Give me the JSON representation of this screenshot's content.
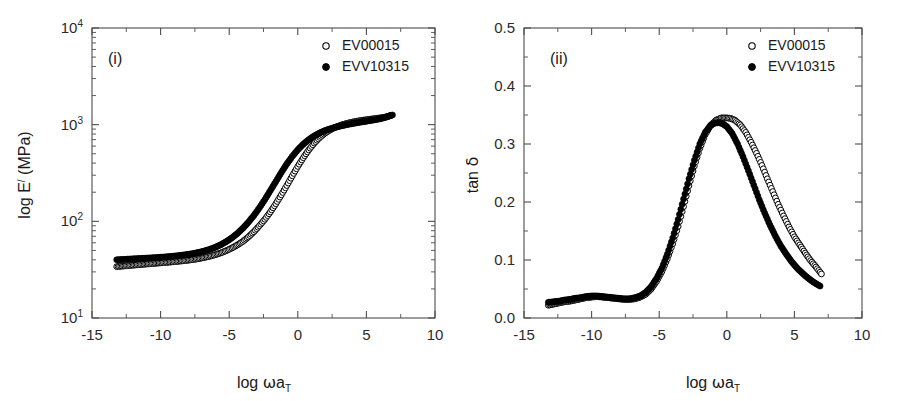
{
  "figure": {
    "background": "#ffffff",
    "series_colors": {
      "open": "#000000",
      "filled": "#000000"
    }
  },
  "panels": [
    {
      "id": "panel-i",
      "label": "(i)",
      "legend": [
        {
          "marker": "open-circle",
          "label": "EV00015"
        },
        {
          "marker": "filled-circle",
          "label": "EVV10315"
        }
      ],
      "chart_data": {
        "type": "scatter",
        "title": "",
        "xlabel": "log ωa_T",
        "ylabel": "log E′ (MPa)",
        "xlim": [
          -15,
          10
        ],
        "ylim": [
          10,
          10000
        ],
        "yscale": "log",
        "xscale": "linear",
        "grid": false,
        "legend_position": "top-right",
        "xticks": [
          -15,
          -10,
          -5,
          0,
          5,
          10
        ],
        "xticklabels": [
          "-15",
          "-10",
          "-5",
          "0",
          "5",
          "10"
        ],
        "yticks": [
          10,
          100,
          1000,
          10000
        ],
        "yticklabels": [
          "10¹",
          "10²",
          "10³",
          "10⁴"
        ],
        "series": [
          {
            "name": "EV00015",
            "marker": "open-circle",
            "x": [
              -13.2,
              -12.8,
              -12.4,
              -12.0,
              -11.6,
              -11.2,
              -10.8,
              -10.4,
              -10.0,
              -9.6,
              -9.2,
              -8.8,
              -8.4,
              -8.0,
              -7.6,
              -7.2,
              -6.8,
              -6.4,
              -6.0,
              -5.6,
              -5.2,
              -4.8,
              -4.4,
              -4.0,
              -3.6,
              -3.2,
              -2.8,
              -2.4,
              -2.0,
              -1.6,
              -1.2,
              -0.8,
              -0.4,
              0.0,
              0.4,
              0.8,
              1.2,
              1.6,
              2.0,
              2.4,
              2.8,
              3.2,
              3.6,
              4.0,
              4.4,
              4.8,
              5.2,
              5.6,
              6.0,
              6.4,
              6.8
            ],
            "y": [
              34,
              34.4,
              34.8,
              35.2,
              35.6,
              36,
              36.4,
              36.8,
              37.2,
              37.6,
              38,
              38.5,
              39,
              39.6,
              40.3,
              41.2,
              42.3,
              43.6,
              45.2,
              47.2,
              49.8,
              53,
              57,
              62,
              69,
              78,
              90,
              105,
              125,
              152,
              188,
              235,
              296,
              370,
              455,
              548,
              645,
              737,
              820,
              890,
              948,
              995,
              1033,
              1065,
              1092,
              1115,
              1135,
              1155,
              1175,
              1200,
              1250
            ]
          },
          {
            "name": "EVV10315",
            "marker": "filled-circle",
            "x": [
              -13.2,
              -12.8,
              -12.4,
              -12.0,
              -11.6,
              -11.2,
              -10.8,
              -10.4,
              -10.0,
              -9.6,
              -9.2,
              -8.8,
              -8.4,
              -8.0,
              -7.6,
              -7.2,
              -6.8,
              -6.4,
              -6.0,
              -5.6,
              -5.2,
              -4.8,
              -4.4,
              -4.0,
              -3.6,
              -3.2,
              -2.8,
              -2.4,
              -2.0,
              -1.6,
              -1.2,
              -0.8,
              -0.4,
              0.0,
              0.4,
              0.8,
              1.2,
              1.6,
              2.0,
              2.4,
              2.8,
              3.2,
              3.6,
              4.0,
              4.4,
              4.8,
              5.2,
              5.6,
              6.0,
              6.4,
              6.9
            ],
            "y": [
              40,
              40.3,
              40.6,
              40.9,
              41.2,
              41.5,
              41.8,
              42.1,
              42.5,
              42.9,
              43.4,
              44,
              44.7,
              45.5,
              46.5,
              47.8,
              49.4,
              51.4,
              54,
              57.4,
              61.8,
              67.5,
              75,
              85,
              98,
              115,
              138,
              168,
              208,
              258,
              320,
              392,
              470,
              550,
              628,
              700,
              765,
              822,
              870,
              910,
              945,
              975,
              1002,
              1028,
              1052,
              1075,
              1098,
              1122,
              1150,
              1190,
              1260
            ]
          }
        ]
      }
    },
    {
      "id": "panel-ii",
      "label": "(ii)",
      "legend": [
        {
          "marker": "open-circle",
          "label": "EV00015"
        },
        {
          "marker": "filled-circle",
          "label": "EVV10315"
        }
      ],
      "chart_data": {
        "type": "scatter",
        "title": "",
        "xlabel": "log ωa_T",
        "ylabel": "tan δ",
        "xlim": [
          -15,
          10
        ],
        "ylim": [
          0.0,
          0.5
        ],
        "yscale": "linear",
        "xscale": "linear",
        "grid": false,
        "legend_position": "top-right",
        "xticks": [
          -15,
          -10,
          -5,
          0,
          5,
          10
        ],
        "xticklabels": [
          "-15",
          "-10",
          "-5",
          "0",
          "5",
          "10"
        ],
        "yticks": [
          0.0,
          0.1,
          0.2,
          0.3,
          0.4,
          0.5
        ],
        "yticklabels": [
          "0.0",
          "0.1",
          "0.2",
          "0.3",
          "0.4",
          "0.5"
        ],
        "series": [
          {
            "name": "EV00015",
            "marker": "open-circle",
            "x": [
              -13.2,
              -12.8,
              -12.4,
              -12.0,
              -11.6,
              -11.2,
              -10.8,
              -10.4,
              -10.0,
              -9.6,
              -9.2,
              -8.8,
              -8.4,
              -8.0,
              -7.6,
              -7.2,
              -6.8,
              -6.4,
              -6.0,
              -5.6,
              -5.2,
              -4.8,
              -4.4,
              -4.0,
              -3.6,
              -3.2,
              -2.8,
              -2.4,
              -2.0,
              -1.6,
              -1.2,
              -0.8,
              -0.4,
              0.0,
              0.3,
              0.6,
              1.0,
              1.4,
              1.8,
              2.2,
              2.6,
              3.0,
              3.4,
              3.8,
              4.2,
              4.6,
              5.0,
              5.4,
              5.8,
              6.2,
              6.6,
              7.0
            ],
            "y": [
              0.022,
              0.024,
              0.026,
              0.028,
              0.029,
              0.031,
              0.033,
              0.035,
              0.036,
              0.037,
              0.036,
              0.035,
              0.034,
              0.033,
              0.032,
              0.032,
              0.033,
              0.036,
              0.041,
              0.05,
              0.063,
              0.08,
              0.102,
              0.128,
              0.158,
              0.192,
              0.228,
              0.262,
              0.292,
              0.316,
              0.332,
              0.341,
              0.345,
              0.345,
              0.344,
              0.341,
              0.333,
              0.32,
              0.303,
              0.284,
              0.263,
              0.24,
              0.218,
              0.196,
              0.176,
              0.157,
              0.14,
              0.126,
              0.112,
              0.099,
              0.088,
              0.076
            ]
          },
          {
            "name": "EVV10315",
            "marker": "filled-circle",
            "x": [
              -13.2,
              -12.8,
              -12.4,
              -12.0,
              -11.6,
              -11.2,
              -10.8,
              -10.4,
              -10.0,
              -9.6,
              -9.2,
              -8.8,
              -8.4,
              -8.0,
              -7.6,
              -7.2,
              -6.8,
              -6.4,
              -6.0,
              -5.6,
              -5.2,
              -4.8,
              -4.4,
              -4.0,
              -3.6,
              -3.2,
              -2.8,
              -2.4,
              -2.0,
              -1.6,
              -1.2,
              -0.9,
              -0.6,
              -0.3,
              0.0,
              0.4,
              0.8,
              1.2,
              1.6,
              2.0,
              2.4,
              2.8,
              3.2,
              3.6,
              4.0,
              4.4,
              4.8,
              5.2,
              5.6,
              6.0,
              6.4,
              6.9
            ],
            "y": [
              0.027,
              0.028,
              0.029,
              0.031,
              0.032,
              0.034,
              0.035,
              0.037,
              0.038,
              0.038,
              0.037,
              0.036,
              0.035,
              0.034,
              0.033,
              0.033,
              0.035,
              0.038,
              0.044,
              0.054,
              0.068,
              0.086,
              0.11,
              0.138,
              0.17,
              0.205,
              0.24,
              0.272,
              0.3,
              0.32,
              0.332,
              0.336,
              0.337,
              0.335,
              0.33,
              0.318,
              0.3,
              0.278,
              0.254,
              0.229,
              0.204,
              0.181,
              0.16,
              0.141,
              0.124,
              0.11,
              0.097,
              0.086,
              0.077,
              0.069,
              0.062,
              0.055
            ]
          }
        ]
      }
    }
  ]
}
